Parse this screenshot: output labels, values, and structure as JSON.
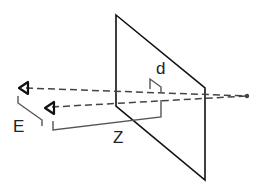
{
  "diagram": {
    "labels": {
      "d": "d",
      "E": "E",
      "Z": "Z"
    },
    "colors": {
      "plane": "#111111",
      "rays": "#444444",
      "brackets": "#555555",
      "eyes": "#111111",
      "point": "#444444"
    },
    "elements": {
      "plane": "projection plane (screen)",
      "eye_left": "left eye",
      "eye_right": "right eye",
      "rays": "dashed lines of sight to point",
      "point": "target point behind plane",
      "bracket_E": "eye separation",
      "bracket_Z": "viewing distance",
      "bracket_d": "disparity on plane"
    }
  }
}
